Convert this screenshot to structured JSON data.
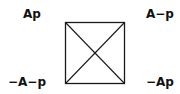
{
  "diagram": {
    "type": "square-of-opposition",
    "corners": {
      "top_left": "Ap",
      "top_right": "A−p",
      "bottom_left": "−A−p",
      "bottom_right": "−Ap"
    },
    "line_color": "#1a1a1a"
  }
}
